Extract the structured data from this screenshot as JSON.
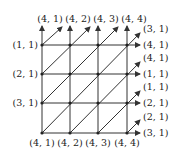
{
  "diagram": {
    "top_labels": [
      "(4, 1)",
      "(4, 2)",
      "(4, 3)",
      "(4, 4)"
    ],
    "bottom_labels": [
      "(4, 1)",
      "(4, 2)",
      "(4, 3)",
      "(4, 4)"
    ],
    "left_labels": [
      "(1, 1)",
      "(2, 1)",
      "(3, 1)"
    ],
    "right_row_labels": [
      "(4, 1)",
      "(1, 1)",
      "(2, 1)",
      "(3, 1)"
    ],
    "right_diag_labels": [
      "(3, 1)",
      "(4, 1)",
      "(1, 1)",
      "(2, 1)"
    ],
    "colors": {
      "line": "#333333",
      "text": "#222222"
    }
  }
}
